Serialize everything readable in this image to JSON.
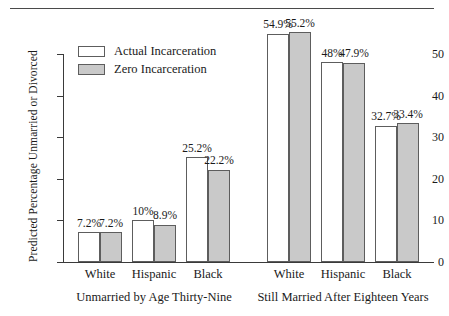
{
  "chart_data": {
    "type": "bar",
    "title": "",
    "xlabel": "",
    "ylabel": "Predicted Percentage Unmarried or Divorced",
    "ylim": [
      0,
      50
    ],
    "yticks": [
      0,
      10,
      20,
      30,
      40,
      50
    ],
    "ytick_labels": [
      "0",
      "10",
      "20",
      "30",
      "40",
      "50"
    ],
    "grid": false,
    "legend_position": "top-left",
    "panels": [
      {
        "label": "Unmarried by Age Thirty-Nine",
        "categories": [
          "White",
          "Hispanic",
          "Black"
        ],
        "series": [
          {
            "name": "Actual Incarceration",
            "values": [
              7.2,
              10.0,
              25.2
            ],
            "labels": [
              "7.2%",
              "10%",
              "25.2%"
            ]
          },
          {
            "name": "Zero Incarceration",
            "values": [
              7.2,
              8.9,
              22.2
            ],
            "labels": [
              "7.2%",
              "8.9%",
              "22.2%"
            ]
          }
        ]
      },
      {
        "label": "Still Married After Eighteen Years",
        "categories": [
          "White",
          "Hispanic",
          "Black"
        ],
        "series": [
          {
            "name": "Actual Incarceration",
            "values": [
              54.9,
              48.0,
              32.7
            ],
            "labels": [
              "54.9%",
              "48%",
              "32.7%"
            ]
          },
          {
            "name": "Zero Incarceration",
            "values": [
              55.2,
              47.9,
              33.4
            ],
            "labels": [
              "55.2%",
              "47.9%",
              "33.4%"
            ]
          }
        ]
      }
    ],
    "legend": [
      {
        "name": "Actual Incarceration",
        "color": "#ffffff"
      },
      {
        "name": "Zero Incarceration",
        "color": "#c9c9c9"
      }
    ],
    "colors": {
      "actual_fill": "#ffffff",
      "zero_fill": "#c9c9c9",
      "bar_stroke": "#5d5d5d",
      "axis": "#3a3a3a"
    }
  }
}
